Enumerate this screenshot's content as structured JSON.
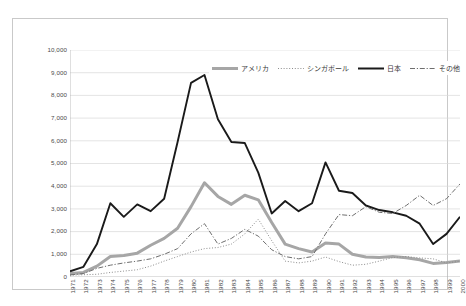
{
  "chart_data": {
    "type": "line",
    "title": "",
    "xlabel": "",
    "ylabel": "",
    "grid": true,
    "legend_position": "top-right",
    "ylim": [
      0,
      10000
    ],
    "yticks": [
      0,
      1000,
      2000,
      3000,
      4000,
      5000,
      6000,
      7000,
      8000,
      9000,
      10000
    ],
    "ytick_labels": [
      "0",
      "1,000",
      "2,000",
      "3,000",
      "4,000",
      "5,000",
      "6,000",
      "7,000",
      "8,000",
      "9,000",
      "10,000"
    ],
    "categories": [
      "1971",
      "1972",
      "1973",
      "1974",
      "1975",
      "1976",
      "1977",
      "1978",
      "1979",
      "1980",
      "1981",
      "1982",
      "1983",
      "1984",
      "1985",
      "1986",
      "1987",
      "1988",
      "1989",
      "1990",
      "1991",
      "1992",
      "1993",
      "1994",
      "1995",
      "1996",
      "1997",
      "1998",
      "1999",
      "2000"
    ],
    "series": [
      {
        "name": "アメリカ",
        "color": "#a6a6a6",
        "style": "solid-thick",
        "values": [
          150,
          200,
          480,
          900,
          950,
          1050,
          1400,
          1700,
          2150,
          3100,
          4150,
          3550,
          3200,
          3600,
          3400,
          2400,
          1450,
          1250,
          1100,
          1500,
          1450,
          1000,
          880,
          860,
          900,
          850,
          760,
          600,
          640,
          700
        ]
      },
      {
        "name": "シンガポール",
        "color": "#8c8c8c",
        "style": "dotted",
        "values": [
          80,
          100,
          120,
          200,
          260,
          320,
          480,
          700,
          900,
          1100,
          1250,
          1300,
          1450,
          1900,
          2550,
          1600,
          700,
          620,
          700,
          880,
          680,
          520,
          560,
          700,
          860,
          900,
          840,
          800,
          620,
          700
        ]
      },
      {
        "name": "日本",
        "color": "#1a1a1a",
        "style": "solid-thick-dark",
        "values": [
          250,
          450,
          1450,
          3250,
          2650,
          3200,
          2900,
          3450,
          5950,
          8550,
          8900,
          6950,
          5950,
          5900,
          4600,
          2800,
          3350,
          2900,
          3250,
          5050,
          3800,
          3700,
          3150,
          2950,
          2850,
          2700,
          2350,
          1450,
          1900,
          2650
        ]
      },
      {
        "name": "その他",
        "color": "#6e6e6e",
        "style": "dashdot",
        "values": [
          90,
          150,
          380,
          520,
          620,
          700,
          800,
          1000,
          1250,
          1900,
          2350,
          1450,
          1700,
          2100,
          1800,
          1200,
          900,
          800,
          900,
          1900,
          2750,
          2700,
          3100,
          2850,
          2800,
          3150,
          3600,
          3150,
          3450,
          4100
        ]
      }
    ]
  },
  "legend": {
    "items": [
      {
        "label": "アメリカ",
        "icon": "line-solid-thick-gray"
      },
      {
        "label": "シンガポール",
        "icon": "line-dotted-gray"
      },
      {
        "label": "日本",
        "icon": "line-solid-thick-black"
      },
      {
        "label": "その他",
        "icon": "line-dashdot-gray"
      }
    ]
  }
}
